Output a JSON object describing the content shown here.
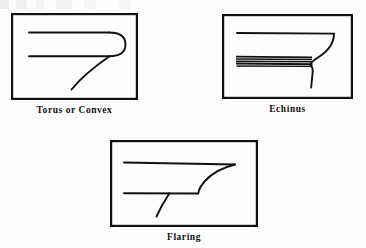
{
  "page": {
    "background_color": "#fdfdfd",
    "ink_color": "#111111",
    "artifact": "faint-scan-streak-top-edge"
  },
  "figures": [
    {
      "id": "torus",
      "caption": "Torus or Convex",
      "frame": {
        "x": 11,
        "y": 13,
        "width": 127,
        "height": 87
      },
      "profile_type": "torus-convex-molding",
      "description": "Two parallel horizontal lines closed at the right by a semicircular convex cap, with a diagonal tail descending to the lower left."
    },
    {
      "id": "echinus",
      "caption": "Echinus",
      "frame": {
        "x": 222,
        "y": 14,
        "width": 131,
        "height": 85
      },
      "profile_type": "echinus-molding",
      "description": "A long upper horizontal line terminating in a concave ovolo sweep at the right, above a dark banded fillet of closely spaced horizontal lines, with a vertical shaft dropping below."
    },
    {
      "id": "flaring",
      "caption": "Flaring",
      "frame": {
        "x": 110,
        "y": 140,
        "width": 148,
        "height": 87
      },
      "profile_type": "flaring-molding",
      "description": "An upper horizontal line meeting a flaring concave curve that descends to a lower horizontal line, with a short tail curving downward."
    }
  ]
}
